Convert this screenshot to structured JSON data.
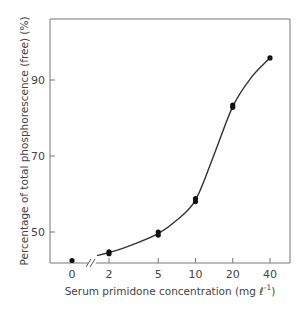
{
  "chart_data": {
    "type": "line",
    "title": "",
    "xlabel": "Serum primidone concentration (mg ℓ⁻¹)",
    "ylabel": "Percentage of total phosphorescence (free) (%)",
    "x_scale": "log (with axis break between 0 and 2)",
    "x_ticks": [
      "0",
      "2",
      "5",
      "10",
      "20",
      "40"
    ],
    "y_ticks": [
      50,
      70,
      90
    ],
    "ylim": [
      42,
      104
    ],
    "grid": false,
    "legend": null,
    "series": [
      {
        "name": "measured points",
        "style": "filled circles",
        "x": [
          0,
          2,
          2,
          5,
          5,
          10,
          10,
          20,
          20,
          40
        ],
        "y": [
          42.5,
          44.3,
          44.8,
          49.2,
          50.0,
          58.0,
          58.8,
          82.8,
          83.4,
          95.8
        ]
      },
      {
        "name": "fitted curve",
        "style": "smooth line (sigmoid)",
        "x": [
          1.6,
          2,
          3,
          5,
          7,
          10,
          14,
          20,
          28,
          40
        ],
        "y": [
          43.8,
          44.6,
          46.5,
          49.6,
          53.0,
          58.4,
          70.0,
          83.0,
          90.5,
          95.8
        ]
      }
    ]
  },
  "labels": {
    "xlabel_main": "Serum primidone concentration (mg ",
    "xlabel_unit": "ℓ",
    "xlabel_exp": "-1",
    "xlabel_close": ")",
    "ylabel": "Percentage of total phosphorescence (free) (%)",
    "break_mark": "//"
  }
}
